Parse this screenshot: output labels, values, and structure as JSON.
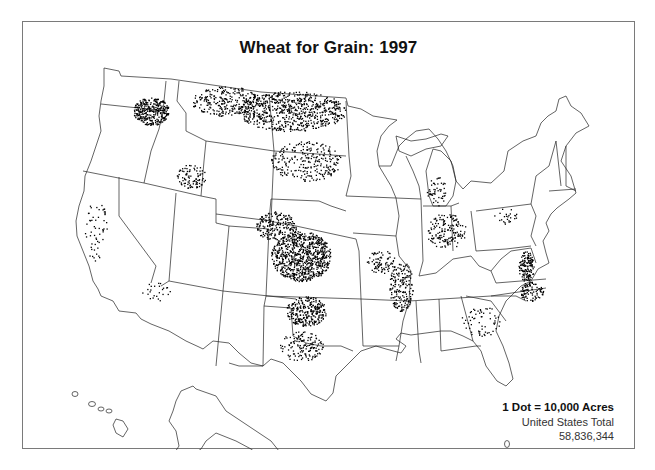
{
  "map": {
    "title": "Wheat for Grain:  1997",
    "type": "dot-density",
    "legend": {
      "scale": "1 Dot = 10,000 Acres",
      "total_label": "United States Total",
      "total_value": "58,836,344"
    },
    "colors": {
      "frame": "#7a7a7a",
      "outline": "#222222",
      "dot": "#000000",
      "background": "#ffffff"
    }
  },
  "chart_data": {
    "type": "dot-density map",
    "title": "Wheat for Grain:  1997",
    "unit": "1 Dot = 10,000 Acres",
    "total": 58836344,
    "regions_density": [
      {
        "region": "Northern Plains (ND/MT/SD)",
        "density": "very high"
      },
      {
        "region": "Central Plains (KS/OK/E. CO/NE panhandle)",
        "density": "very high"
      },
      {
        "region": "Palouse (E. WA/N. ID/NE OR)",
        "density": "high"
      },
      {
        "region": "Texas Panhandle / N. TX",
        "density": "medium"
      },
      {
        "region": "Mississippi Delta corridor (AR/MO/TN/IL)",
        "density": "medium"
      },
      {
        "region": "Ohio / Indiana / Michigan",
        "density": "medium"
      },
      {
        "region": "Mid-Atlantic (MD/DE/VA/NC)",
        "density": "medium"
      },
      {
        "region": "Southern Idaho",
        "density": "medium"
      },
      {
        "region": "California Central Valley",
        "density": "low"
      },
      {
        "region": "Southeast (GA/SC)",
        "density": "low"
      },
      {
        "region": "Rocky Mountain / Southwest",
        "density": "very low"
      }
    ]
  }
}
